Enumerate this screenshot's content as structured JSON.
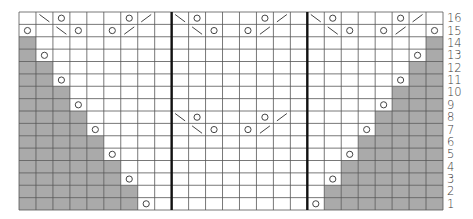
{
  "chart_title": "",
  "colors": {
    "background": "#ffffff",
    "shaded": "#aaaaaa",
    "grid_line": "#555555",
    "section_divider": "#111111",
    "symbol": "#444444",
    "label": "#3a3a3a"
  },
  "legend_symbols": {
    "o": "yarn-over",
    "\\": "left-slanting-decrease",
    "/": "right-slanting-decrease",
    "#": "no-stitch-shaded",
    ".": "knit-blank"
  },
  "grid": {
    "columns": 25,
    "rows": 16,
    "section_column_counts": [
      9,
      8,
      8
    ],
    "row_labels": [
      "16",
      "15",
      "14",
      "13",
      "12",
      "11",
      "10",
      "9",
      "8",
      "7",
      "6",
      "5",
      "4",
      "3",
      "2",
      "1"
    ],
    "cells": [
      ". \\ o . . . o / .   \\ o . . . o / .   \\ o . . . o / .",
      "o . \\ o . o / . .   . \\ o . o / . .   . \\ o . o / . o",
      "# . . . . . . . .   . . . . . . . .   . . . . . . . #",
      "# o . . . . . . .   . . . . . . . .   . . . . . . o #",
      "# # . . . . . . .   . . . . . . . .   . . . . . . # #",
      "# # o . . . . . .   . . . . . . . .   . . . . . o # #",
      "# # # . . . . . .   . . . . . . . .   . . . . . # # #",
      "# # # o . . . . .   . . . . . . . .   . . . . o # # #",
      "# # # # . . . . .   \\ o . . . o / .   . . . . # # # #",
      "# # # # o . . . .   . \\ o . o / . .   . . . o # # # #",
      "# # # # # . . . .   . . . . . . . .   . . . # # # # #",
      "# # # # # o . . .   . . . . . . . .   . . o # # # # #",
      "# # # # # # . . .   . . . . . . . .   . . # # # # # #",
      "# # # # # # o . .   . . . . . . . .   . o # # # # # #",
      "# # # # # # # . .   . . . . . . . .   . # # # # # # #",
      "# # # # # # # o .   . . . . . . . .   o # # # # # # #"
    ]
  },
  "chart_data": {
    "type": "table",
    "row_labels_side": "right",
    "row_labels": [
      16,
      15,
      14,
      13,
      12,
      11,
      10,
      9,
      8,
      7,
      6,
      5,
      4,
      3,
      2,
      1
    ],
    "sections": [
      {
        "name": "left",
        "columns": 9
      },
      {
        "name": "middle",
        "columns": 8
      },
      {
        "name": "right",
        "columns": 8
      }
    ],
    "symbols": {
      "yarn_over_count": 36,
      "left_decrease_count": 8,
      "right_decrease_count": 8
    }
  }
}
